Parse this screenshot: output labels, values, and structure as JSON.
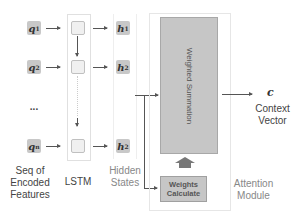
{
  "inputs": {
    "items": [
      {
        "symbol": "q",
        "subscript": "1"
      },
      {
        "symbol": "q",
        "subscript": "2"
      },
      {
        "symbol": "q",
        "subscript": "n"
      }
    ],
    "ellipsis": "...",
    "label_line1": "Seq of",
    "label_line2": "Encoded",
    "label_line3": "Features"
  },
  "lstm": {
    "label": "LSTM"
  },
  "hidden_states": {
    "items": [
      {
        "symbol": "h",
        "subscript": "1"
      },
      {
        "symbol": "h",
        "subscript": "2"
      },
      {
        "symbol": "h",
        "subscript": "2"
      }
    ],
    "label_line1": "Hidden",
    "label_line2": "States"
  },
  "attention": {
    "weighted_summation": "Weighted Summation",
    "weights_line1": "Weights",
    "weights_line2": "Calculate",
    "label_line1": "Attention",
    "label_line2": "Module"
  },
  "output": {
    "symbol": "c",
    "label_line1": "Context",
    "label_line2": "Vector"
  },
  "colors": {
    "box_fill": "#c6c6c6",
    "cell_fill": "#f0f0f0",
    "arrow": "#555555"
  }
}
